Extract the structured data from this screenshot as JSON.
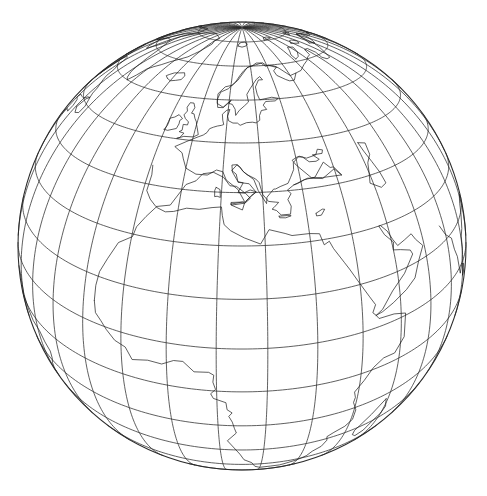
{
  "figure": {
    "domain": "Map",
    "caption": "",
    "title": "",
    "background_color": "#ffffff",
    "line_color": "#2b2b2b",
    "coastline_color": "#1a1a1a"
  },
  "map": {
    "name": "world-globe-graticule",
    "projection": "tilted perspective (near-side vertical perspective) of the globe",
    "description": "Outline world map of the eastern Atlantic hemisphere drawn on a globe seen from space, with a 10-degree latitude/longitude graticule. The North Pole appears in the upper-middle of the disc; Europe, Africa, Greenland, eastern North America, Arabia and India are visible.",
    "hemisphere": "Northern-pole-tilted",
    "center_latitude": 30,
    "center_longitude": 15,
    "tilt_degrees": 62,
    "graticule_interval_degrees": 10,
    "meridian_count": 36,
    "parallel_count": 17,
    "pole_marked": "North Pole",
    "disc": {
      "center_x": 242,
      "center_y": 246,
      "radius": 224
    },
    "visible_regions": [
      "North Pole",
      "Greenland",
      "Iceland",
      "Scandinavia",
      "British Isles",
      "Europe",
      "Mediterranean Sea",
      "North Africa",
      "Sub-Saharan Africa",
      "Madagascar",
      "Arabian Peninsula",
      "India",
      "Siberia",
      "Alaska",
      "Canada",
      "Eastern North America",
      "Central America",
      "Caribbean",
      "South America (northern)"
    ],
    "axis_labels": {
      "latitude": "",
      "longitude": ""
    },
    "tick_labels": []
  },
  "chart_data": {
    "type": "map",
    "title": "",
    "xlabel": "",
    "ylabel": "",
    "projection": "tilted perspective",
    "graticule": {
      "latitudes": [
        0,
        10,
        20,
        30,
        40,
        50,
        60,
        70,
        80,
        -10,
        -20,
        -30,
        -40,
        -50,
        -60,
        -70,
        -80
      ],
      "longitudes": [
        -180,
        -170,
        -160,
        -150,
        -140,
        -130,
        -120,
        -110,
        -100,
        -90,
        -80,
        -70,
        -60,
        -50,
        -40,
        -30,
        -20,
        -10,
        0,
        10,
        20,
        30,
        40,
        50,
        60,
        70,
        80,
        90,
        100,
        110,
        120,
        130,
        140,
        150,
        160,
        170
      ],
      "interval_degrees": 10,
      "grid": true
    },
    "view": {
      "center_lat": 30,
      "center_lon": 15,
      "distance_earth_radii": 3.2
    },
    "legend": null
  }
}
